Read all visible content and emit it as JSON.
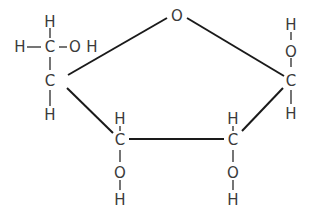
{
  "diagram": {
    "type": "chemical-structure",
    "colors": {
      "bond": "#1a1a1a",
      "atom": "#3a3a3a",
      "background": "#ffffff"
    },
    "atoms": {
      "ring_o": "O",
      "c4": "C",
      "c4_h_top": "H",
      "c4_oh_o": "O",
      "c4_oh_h": "H",
      "ch2_c": "C",
      "ch2_h_top": "H",
      "ch2_h_left": "H",
      "ch2_o": "O",
      "ch2_h_right": "H",
      "c1": "C",
      "c1_o": "O",
      "c1_h_top": "H",
      "c1_h_bottom": "H",
      "c3": "C",
      "c3_h": "H",
      "c3_o": "O",
      "c3_oh_h": "H",
      "c2": "C",
      "c2_h": "H",
      "c2_o": "O",
      "c2_oh_h": "H",
      "c4_h_bottom": "H"
    }
  }
}
